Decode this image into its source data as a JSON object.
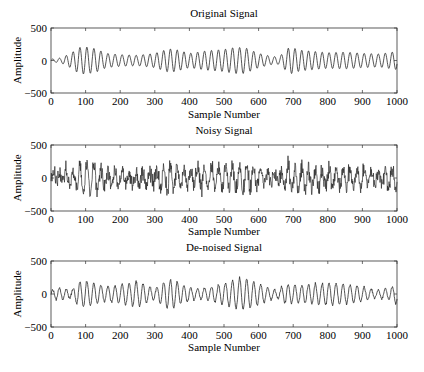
{
  "figure": {
    "width": 424,
    "height": 372,
    "background": "#ffffff",
    "line_color": "#2a2a2a"
  },
  "chart_data": [
    {
      "type": "line",
      "title": "Original Signal",
      "xlabel": "Sample Number",
      "ylabel": "Amplitude",
      "xlim": [
        0,
        1000
      ],
      "ylim": [
        -500,
        500
      ],
      "xticks": [
        0,
        100,
        200,
        300,
        400,
        500,
        600,
        700,
        800,
        900,
        1000
      ],
      "yticks": [
        -500,
        0,
        500
      ],
      "xtick_labels": [
        "0",
        "100",
        "200",
        "300",
        "400",
        "500",
        "600",
        "700",
        "800",
        "900",
        "1000"
      ],
      "ytick_labels": [
        "−500",
        "0",
        "500"
      ],
      "grid": false,
      "description": "Quasi-periodic oscillation (~50 cycles over 1000 samples), smooth, amplitude envelope varying ~50–230",
      "series": [
        {
          "name": "original",
          "period_samples": 20,
          "noise": 0,
          "envelope_x": [
            0,
            30,
            60,
            80,
            100,
            130,
            160,
            200,
            250,
            300,
            340,
            360,
            400,
            450,
            500,
            530,
            560,
            600,
            640,
            660,
            690,
            720,
            760,
            800,
            850,
            900,
            950,
            1000
          ],
          "envelope_y": [
            20,
            40,
            120,
            200,
            210,
            180,
            110,
            90,
            80,
            110,
            180,
            170,
            110,
            150,
            170,
            200,
            200,
            110,
            60,
            60,
            210,
            160,
            140,
            120,
            130,
            110,
            100,
            140
          ]
        }
      ]
    },
    {
      "type": "line",
      "title": "Noisy Signal",
      "xlabel": "Sample Number",
      "ylabel": "Amplitude",
      "xlim": [
        0,
        1000
      ],
      "ylim": [
        -500,
        500
      ],
      "xticks": [
        0,
        100,
        200,
        300,
        400,
        500,
        600,
        700,
        800,
        900,
        1000
      ],
      "yticks": [
        -500,
        0,
        500
      ],
      "xtick_labels": [
        "0",
        "100",
        "200",
        "300",
        "400",
        "500",
        "600",
        "700",
        "800",
        "900",
        "1000"
      ],
      "ytick_labels": [
        "−500",
        "0",
        "500"
      ],
      "grid": false,
      "description": "Original signal plus random noise; peaks reach ~±400",
      "series": [
        {
          "name": "noisy",
          "period_samples": 20,
          "noise": 110,
          "envelope_x": [
            0,
            30,
            60,
            80,
            100,
            130,
            160,
            200,
            250,
            300,
            340,
            360,
            400,
            450,
            500,
            530,
            560,
            600,
            640,
            660,
            690,
            720,
            760,
            800,
            850,
            900,
            950,
            1000
          ],
          "envelope_y": [
            20,
            40,
            120,
            200,
            210,
            180,
            110,
            90,
            80,
            110,
            180,
            170,
            110,
            150,
            170,
            200,
            200,
            110,
            60,
            60,
            210,
            160,
            140,
            120,
            130,
            110,
            100,
            140
          ]
        }
      ]
    },
    {
      "type": "line",
      "title": "De-noised Signal",
      "xlabel": "Sample Number",
      "ylabel": "Amplitude",
      "xlim": [
        0,
        1000
      ],
      "ylim": [
        -500,
        500
      ],
      "xticks": [
        0,
        100,
        200,
        300,
        400,
        500,
        600,
        700,
        800,
        900,
        1000
      ],
      "yticks": [
        -500,
        0,
        500
      ],
      "xtick_labels": [
        "0",
        "100",
        "200",
        "300",
        "400",
        "500",
        "600",
        "700",
        "800",
        "900",
        "1000"
      ],
      "ytick_labels": [
        "−500",
        "0",
        "500"
      ],
      "grid": false,
      "description": "Recovered oscillation close to original, amplitude ~50–250",
      "series": [
        {
          "name": "denoised",
          "period_samples": 20,
          "noise": 15,
          "envelope_x": [
            0,
            20,
            60,
            80,
            100,
            130,
            160,
            200,
            250,
            300,
            330,
            350,
            380,
            420,
            460,
            500,
            550,
            580,
            620,
            650,
            680,
            720,
            760,
            800,
            850,
            900,
            940,
            980,
            1000
          ],
          "envelope_y": [
            60,
            90,
            60,
            180,
            200,
            150,
            110,
            140,
            190,
            80,
            200,
            230,
            130,
            80,
            100,
            160,
            250,
            200,
            120,
            50,
            150,
            130,
            150,
            170,
            150,
            110,
            60,
            90,
            160
          ]
        }
      ]
    }
  ],
  "layout": {
    "plots": [
      {
        "left": 51,
        "right": 397,
        "top": 28,
        "bottom": 93,
        "title_y": 17,
        "xlabel_y": 118
      },
      {
        "left": 51,
        "right": 397,
        "top": 145,
        "bottom": 211,
        "title_y": 134,
        "xlabel_y": 235
      },
      {
        "left": 51,
        "right": 397,
        "top": 261,
        "bottom": 327,
        "title_y": 251,
        "xlabel_y": 351
      }
    ]
  }
}
